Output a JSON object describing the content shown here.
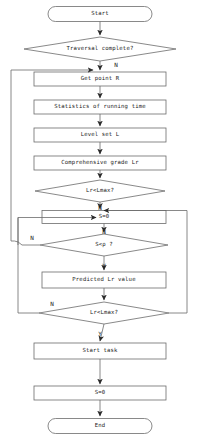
{
  "diagram": {
    "type": "flowchart",
    "nodes": [
      {
        "id": "start",
        "shape": "terminal",
        "label": "Start",
        "cx": 100,
        "cy": 14,
        "w": 104,
        "h": 15
      },
      {
        "id": "traversal",
        "shape": "decision",
        "label": "Traversal complete?",
        "cx": 100,
        "cy": 49,
        "w": 152,
        "h": 24
      },
      {
        "id": "getpoint",
        "shape": "process",
        "label": "Get point R",
        "cx": 100,
        "cy": 79,
        "w": 132,
        "h": 14
      },
      {
        "id": "stats",
        "shape": "process",
        "label": "Statistics of running time",
        "cx": 100,
        "cy": 107,
        "w": 132,
        "h": 14
      },
      {
        "id": "levelset",
        "shape": "process",
        "label": "Level set L",
        "cx": 100,
        "cy": 135,
        "w": 132,
        "h": 14
      },
      {
        "id": "compgrade",
        "shape": "process",
        "label": "Comprehensive grade Lr",
        "cx": 100,
        "cy": 163,
        "w": 132,
        "h": 14
      },
      {
        "id": "lrmax1",
        "shape": "decision",
        "label": "Lr<Lmax?",
        "cx": 100,
        "cy": 191,
        "w": 130,
        "h": 22
      },
      {
        "id": "szero1",
        "shape": "process",
        "label": "S=0",
        "cx": 104,
        "cy": 217,
        "w": 124,
        "h": 13
      },
      {
        "id": "srho",
        "shape": "decision",
        "label": "S<ρ ?",
        "cx": 104,
        "cy": 245,
        "w": 128,
        "h": 22
      },
      {
        "id": "predicted",
        "shape": "process",
        "label": "Predicted Lr value",
        "cx": 104,
        "cy": 280,
        "w": 124,
        "h": 16
      },
      {
        "id": "lrmax2",
        "shape": "decision",
        "label": "Lr<Lmax?",
        "cx": 104,
        "cy": 313,
        "w": 130,
        "h": 22
      },
      {
        "id": "starttask",
        "shape": "process",
        "label": "Start task",
        "cx": 100,
        "cy": 351,
        "w": 132,
        "h": 16
      },
      {
        "id": "szero2",
        "shape": "process",
        "label": "S=0",
        "cx": 100,
        "cy": 393,
        "w": 132,
        "h": 14
      },
      {
        "id": "end",
        "shape": "terminal",
        "label": "End",
        "cx": 100,
        "cy": 426,
        "w": 104,
        "h": 15
      }
    ],
    "edge_labels": [
      {
        "id": "n-traversal",
        "text": "N",
        "x": 116,
        "y": 65
      },
      {
        "id": "n-lrmax1",
        "text": "N",
        "x": 100,
        "y": 208
      },
      {
        "id": "n-srho-left",
        "text": "N",
        "x": 32,
        "y": 238
      },
      {
        "id": "n-srho-top",
        "text": "N",
        "x": 104,
        "y": 232
      },
      {
        "id": "y-srho",
        "text": "Y",
        "x": 104,
        "y": 266
      },
      {
        "id": "n-lrmax2",
        "text": "N",
        "x": 52,
        "y": 304
      },
      {
        "id": "y-lrmax2",
        "text": "Y",
        "x": 100,
        "y": 334
      }
    ],
    "colors": {
      "stroke": "#6b6b6b",
      "text": "#1a1a1a",
      "arrow": "#2b2b2b",
      "background": "#ffffff"
    }
  }
}
